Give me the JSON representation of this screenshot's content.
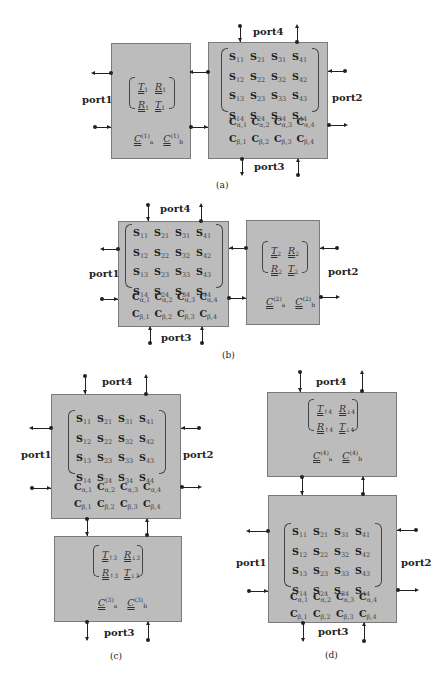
{
  "ports": {
    "p1": "port1",
    "p2": "port2",
    "p3": "port3",
    "p4": "port4"
  },
  "captions": {
    "a": "(a)",
    "b": "(b)",
    "c": "(c)",
    "d": "(d)"
  },
  "s_matrix": {
    "rows": [
      [
        {
          "b": "S",
          "s": "11"
        },
        {
          "b": "S",
          "s": "21"
        },
        {
          "b": "S",
          "s": "31"
        },
        {
          "b": "S",
          "s": "41"
        }
      ],
      [
        {
          "b": "S",
          "s": "12"
        },
        {
          "b": "S",
          "s": "22"
        },
        {
          "b": "S",
          "s": "32"
        },
        {
          "b": "S",
          "s": "42"
        }
      ],
      [
        {
          "b": "S",
          "s": "13"
        },
        {
          "b": "S",
          "s": "23"
        },
        {
          "b": "S",
          "s": "33"
        },
        {
          "b": "S",
          "s": "43"
        }
      ],
      [
        {
          "b": "S",
          "s": "14"
        },
        {
          "b": "S",
          "s": "24"
        },
        {
          "b": "S",
          "s": "34"
        },
        {
          "b": "S",
          "s": "44"
        }
      ]
    ],
    "c_rows": [
      [
        {
          "b": "C",
          "s": "α,1"
        },
        {
          "b": "C",
          "s": "α,2"
        },
        {
          "b": "C",
          "s": "α,3"
        },
        {
          "b": "C",
          "s": "α,4"
        }
      ],
      [
        {
          "b": "C",
          "s": "β,1"
        },
        {
          "b": "C",
          "s": "β,2"
        },
        {
          "b": "C",
          "s": "β,3"
        },
        {
          "b": "C",
          "s": "β,4"
        }
      ]
    ]
  },
  "blocks": {
    "b1": {
      "t1": {
        "b": "T",
        "s": "1"
      },
      "t2": {
        "b": "R",
        "s": "1"
      },
      "t3": {
        "b": "R",
        "s": "1"
      },
      "t4": {
        "b": "T",
        "s": "1"
      },
      "ca": {
        "b": "C",
        "s": "a",
        "p": "(1)"
      },
      "cb": {
        "b": "C",
        "s": "b",
        "p": "(1)"
      }
    },
    "b2": {
      "t1": {
        "b": "T",
        "s": "2"
      },
      "t2": {
        "b": "R",
        "s": "2"
      },
      "t3": {
        "b": "R",
        "s": "2"
      },
      "t4": {
        "b": "T",
        "s": "2"
      },
      "ca": {
        "b": "C",
        "s": "a",
        "p": "(2)"
      },
      "cb": {
        "b": "C",
        "s": "b",
        "p": "(2)"
      }
    },
    "b3": {
      "t1": {
        "b": "T",
        "s": "↑3"
      },
      "t2": {
        "b": "R",
        "s": "↓3"
      },
      "t3": {
        "b": "R",
        "s": "↑3"
      },
      "t4": {
        "b": "T",
        "s": "↓3"
      },
      "ca": {
        "b": "C",
        "s": "a",
        "p": "(3)"
      },
      "cb": {
        "b": "C",
        "s": "b",
        "p": "(3)"
      }
    },
    "b4": {
      "t1": {
        "b": "T",
        "s": "↑4"
      },
      "t2": {
        "b": "R",
        "s": "↓4"
      },
      "t3": {
        "b": "R",
        "s": "↑4"
      },
      "t4": {
        "b": "T",
        "s": "↓4"
      },
      "ca": {
        "b": "C",
        "s": "a",
        "p": "(4)"
      },
      "cb": {
        "b": "C",
        "s": "b",
        "p": "(4)"
      }
    }
  }
}
